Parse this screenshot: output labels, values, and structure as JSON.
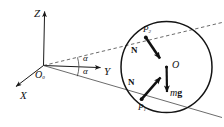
{
  "figure": {
    "background_color": "#ffffff",
    "stroke_color": "#1a1a1a"
  },
  "axes": {
    "z": {
      "label": "Z",
      "name": "z-axis",
      "direction": "up"
    },
    "y": {
      "label": "Y",
      "name": "y-axis",
      "direction": "right"
    },
    "x": {
      "label": "X",
      "name": "x-axis",
      "direction": "down-left"
    },
    "origin": {
      "label": "O",
      "subscript": "0",
      "name": "origin-O0"
    }
  },
  "angles": [
    {
      "label": "α",
      "name": "angle-alpha-upper",
      "position": "above-y-axis"
    },
    {
      "label": "α",
      "name": "angle-alpha-lower",
      "position": "below-y-axis"
    }
  ],
  "sphere": {
    "center_label": "O",
    "name": "sphere-circle",
    "cx": 166.5,
    "cy": 67.0,
    "r": 45.5
  },
  "contact_points": [
    {
      "label": "P",
      "subscript": "2",
      "name": "point-P2",
      "x": 145.0,
      "y": 31.0
    },
    {
      "label": "P",
      "subscript": "1",
      "name": "point-P1",
      "x": 141.0,
      "y": 104.0
    }
  ],
  "vectors": [
    {
      "label": "N",
      "name": "normal-force-upper",
      "bold": true,
      "from": "P2",
      "to": "O"
    },
    {
      "label": "N",
      "name": "normal-force-lower",
      "bold": true,
      "from": "P1",
      "to": "O"
    },
    {
      "label_italic": "m",
      "label_bold": "g",
      "name": "weight-force",
      "from": "O",
      "direction": "down"
    }
  ],
  "lines": [
    {
      "name": "upper-ray-dashed",
      "style": "dashed",
      "from": "O0",
      "through": "P2"
    },
    {
      "name": "lower-ray-solid",
      "style": "solid",
      "from": "O0",
      "through": "P1"
    }
  ]
}
